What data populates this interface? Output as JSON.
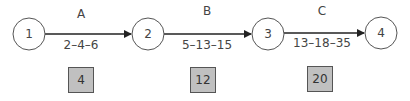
{
  "diagram": {
    "type": "activity-on-arrow network",
    "nodes": [
      {
        "id": "1",
        "cx": 29,
        "cy": 34
      },
      {
        "id": "2",
        "cx": 148,
        "cy": 34
      },
      {
        "id": "3",
        "cx": 268,
        "cy": 34
      },
      {
        "id": "4",
        "cx": 381,
        "cy": 33
      }
    ],
    "activities": [
      {
        "name": "A",
        "estimates": "2–4–6",
        "expected": "4",
        "from": "1",
        "to": "2"
      },
      {
        "name": "B",
        "estimates": "5–13–15",
        "expected": "12",
        "from": "2",
        "to": "3"
      },
      {
        "name": "C",
        "estimates": "13–18–35",
        "expected": "20",
        "from": "3",
        "to": "4"
      }
    ]
  }
}
